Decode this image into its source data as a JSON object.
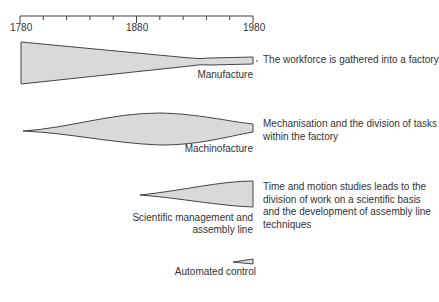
{
  "axis": {
    "start": "1780",
    "mid": "1880",
    "end": "1980",
    "tick_interval_years": 20
  },
  "stages": [
    {
      "label": "Manufacture",
      "description": "The workforce is gathered into a factory"
    },
    {
      "label": "Machinofacture",
      "description_lines": [
        "Mechanisation and the division of tasks",
        "within the factory"
      ]
    },
    {
      "label_lines": [
        "Scientific management and",
        "assembly line"
      ],
      "description_lines": [
        "Time and motion studies leads to the",
        "division of work on a scientific basis",
        "and the development of assembly line",
        "techniques"
      ]
    },
    {
      "label": "Automated control"
    }
  ],
  "colors": {
    "fill": "#d9d9d9",
    "stroke": "#444444"
  }
}
